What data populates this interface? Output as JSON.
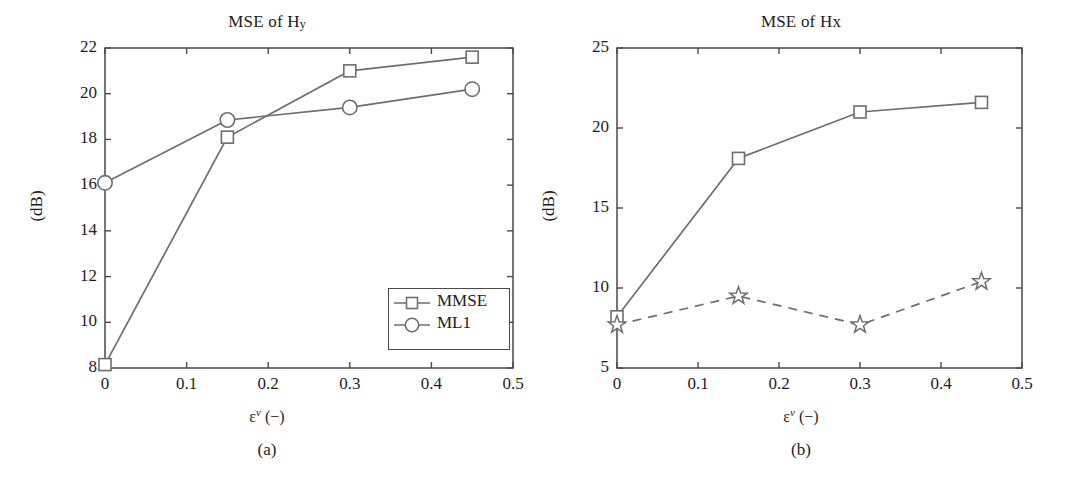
{
  "figure": {
    "width": 1068,
    "height": 479,
    "background": "#ffffff",
    "line_color": "#6e6e6e",
    "axis_color": "#4a4a4a",
    "text_color": "#1d1d1d"
  },
  "panels": [
    {
      "id": "a",
      "caption": "(a)",
      "title_main": "MSE of H",
      "title_sub": "y",
      "ylabel": "(dB)",
      "xlabel_base": "ε",
      "xlabel_sup": "ν",
      "xlabel_tail": " (−)",
      "xticks": [
        "0",
        "0.1",
        "0.2",
        "0.3",
        "0.4",
        "0.5"
      ],
      "yticks": [
        "8",
        "10",
        "12",
        "14",
        "16",
        "18",
        "20",
        "22"
      ],
      "legend": [
        {
          "label": "MMSE",
          "marker": "square",
          "dash": "solid"
        },
        {
          "label": "ML1",
          "marker": "circle",
          "dash": "solid"
        }
      ]
    },
    {
      "id": "b",
      "caption": "(b)",
      "title_main": "MSE of H",
      "title_sub": "x",
      "ylabel": "(dB)",
      "xlabel_base": "ε",
      "xlabel_sup": "ν",
      "xlabel_tail": " (−)",
      "xticks": [
        "0",
        "0.1",
        "0.2",
        "0.3",
        "0.4",
        "0.5"
      ],
      "yticks": [
        "5",
        "10",
        "15",
        "20",
        "25"
      ],
      "legend": [
        {
          "label": "MMSE without off-\ngrid estimation",
          "marker": "square",
          "dash": "solid"
        },
        {
          "label": "MMSE with off-\ngrid estimation",
          "marker": "star",
          "dash": "dashed"
        }
      ]
    }
  ],
  "chart_data": [
    {
      "type": "line",
      "panel": "a",
      "title": "MSE of Hy",
      "xlabel": "εᵛ (−)",
      "ylabel": "(dB)",
      "x": [
        0,
        0.15,
        0.3,
        0.45
      ],
      "xlim": [
        0,
        0.5
      ],
      "ylim": [
        8,
        22
      ],
      "xticks": [
        0,
        0.1,
        0.2,
        0.3,
        0.4,
        0.5
      ],
      "yticks": [
        8,
        10,
        12,
        14,
        16,
        18,
        20,
        22
      ],
      "grid": false,
      "legend_position": "lower-right",
      "series": [
        {
          "name": "MMSE",
          "marker": "square",
          "dash": "solid",
          "values": [
            8.15,
            18.1,
            21.0,
            21.6
          ]
        },
        {
          "name": "ML1",
          "marker": "circle",
          "dash": "solid",
          "values": [
            16.1,
            18.85,
            19.4,
            20.2
          ]
        }
      ]
    },
    {
      "type": "line",
      "panel": "b",
      "title": "MSE of Hx",
      "xlabel": "εᵛ (−)",
      "ylabel": "(dB)",
      "x": [
        0,
        0.15,
        0.3,
        0.45
      ],
      "xlim": [
        0,
        0.5
      ],
      "ylim": [
        5,
        25
      ],
      "xticks": [
        0,
        0.1,
        0.2,
        0.3,
        0.4,
        0.5
      ],
      "yticks": [
        5,
        10,
        15,
        20,
        25
      ],
      "grid": false,
      "legend_position": "center-right",
      "series": [
        {
          "name": "MMSE without off-grid estimation",
          "marker": "square",
          "dash": "solid",
          "values": [
            8.2,
            18.1,
            21.0,
            21.6
          ]
        },
        {
          "name": "MMSE with off-grid estimation",
          "marker": "star",
          "dash": "dashed",
          "values": [
            7.7,
            9.5,
            7.7,
            10.4
          ]
        }
      ]
    }
  ]
}
